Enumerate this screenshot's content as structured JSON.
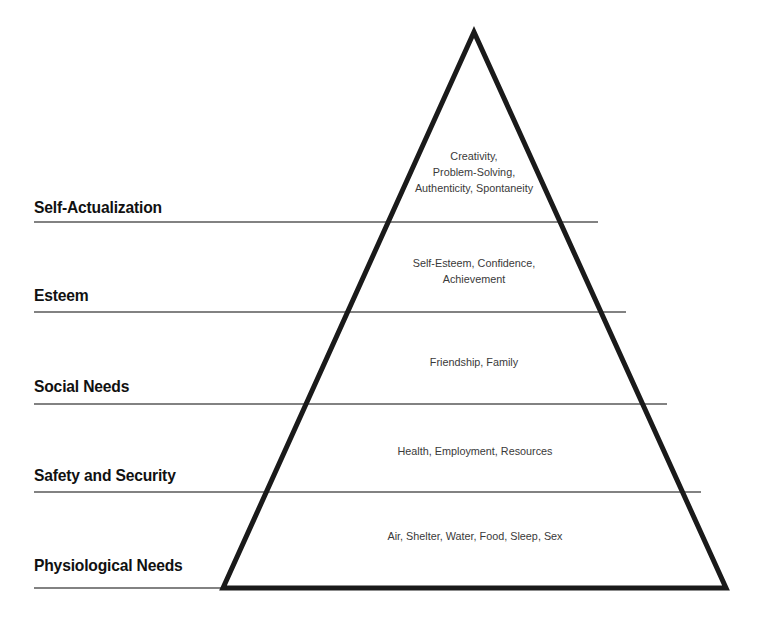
{
  "diagram": {
    "type": "pyramid",
    "name": "maslow-hierarchy-of-needs",
    "background_color": "#ffffff",
    "outline_color": "#1a1a1a",
    "divider_color": "#595959",
    "label_color": "#111111",
    "content_color": "#3a3a3a",
    "levels": [
      {
        "label": "Self-Actualization",
        "content": "Creativity,\nProblem-Solving,\nAuthenticity, Spontaneity"
      },
      {
        "label": "Esteem",
        "content": "Self-Esteem, Confidence,\nAchievement"
      },
      {
        "label": "Social Needs",
        "content": "Friendship, Family"
      },
      {
        "label": "Safety and Security",
        "content": "Health, Employment, Resources"
      },
      {
        "label": "Physiological Needs",
        "content": "Air, Shelter, Water, Food, Sleep, Sex"
      }
    ]
  }
}
